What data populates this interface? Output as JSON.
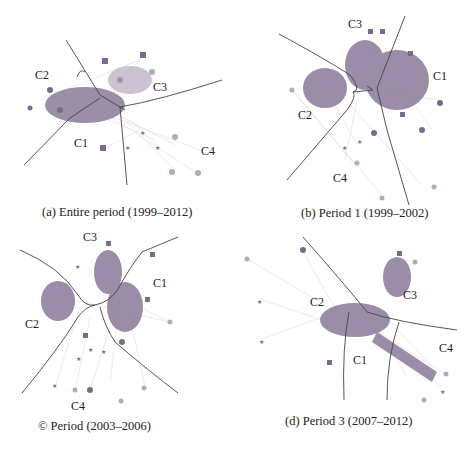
{
  "figure": {
    "panels": [
      {
        "id": "a",
        "caption": "(a) Entire period (1999–2012)",
        "cluster_labels": {
          "C1": "C1",
          "C2": "C2",
          "C3": "C3",
          "C4": "C4"
        }
      },
      {
        "id": "b",
        "caption": "(b) Period 1 (1999–2002)",
        "cluster_labels": {
          "C1": "C1",
          "C2": "C2",
          "C3": "C3",
          "C4": "C4"
        }
      },
      {
        "id": "c",
        "caption": "© Period (2003–2006)",
        "cluster_labels": {
          "C1": "C1",
          "C2": "C2",
          "C3": "C3",
          "C4": "C4"
        }
      },
      {
        "id": "d",
        "caption": "(d) Period 3 (2007–2012)",
        "cluster_labels": {
          "C1": "C1",
          "C2": "C2",
          "C3": "C3",
          "C4": "C4"
        }
      }
    ],
    "colors": {
      "node_core": "#7a6a8c",
      "node_c3": "#b59aa8",
      "node_c4": "#c8b4c0",
      "edge": "#d8ccd6",
      "boundary": "#444444"
    }
  }
}
